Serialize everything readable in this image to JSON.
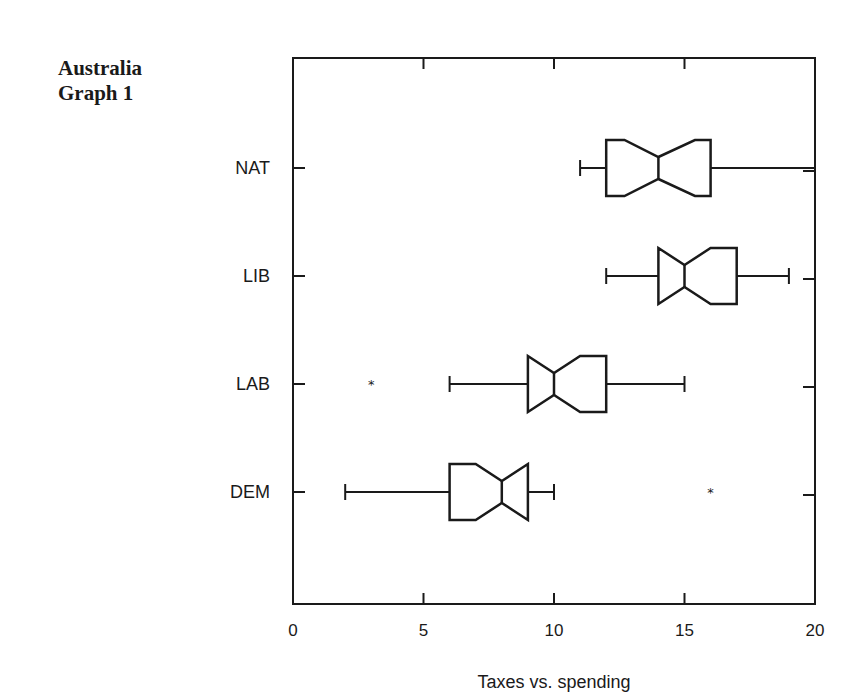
{
  "title": {
    "line1": "Australia",
    "line2": "Graph 1"
  },
  "chart_data": {
    "type": "boxplot",
    "orientation": "horizontal",
    "notched": true,
    "title": "Australia Graph 1",
    "xlabel": "Taxes vs. spending",
    "ylabel": "",
    "xlim": [
      0,
      20
    ],
    "xticks": [
      0,
      5,
      10,
      15,
      20
    ],
    "xtick_labels": [
      "0",
      "5",
      "10",
      "15",
      "20"
    ],
    "grid": false,
    "legend": null,
    "categories": [
      "NAT",
      "LIB",
      "LAB",
      "DEM"
    ],
    "series": [
      {
        "name": "NAT",
        "whisker_low": 11,
        "q1": 12,
        "notch_low": 12.7,
        "median": 14,
        "notch_high": 15.4,
        "q3": 16,
        "whisker_high": 20,
        "outliers": []
      },
      {
        "name": "LIB",
        "whisker_low": 12,
        "q1": 14,
        "notch_low": 14,
        "median": 15,
        "notch_high": 16,
        "q3": 17,
        "whisker_high": 19,
        "outliers": []
      },
      {
        "name": "LAB",
        "whisker_low": 6,
        "q1": 9,
        "notch_low": 9,
        "median": 10,
        "notch_high": 11,
        "q3": 12,
        "whisker_high": 15,
        "outliers": [
          3
        ]
      },
      {
        "name": "DEM",
        "whisker_low": 2,
        "q1": 6,
        "notch_low": 7,
        "median": 8,
        "notch_high": 9,
        "q3": 9,
        "whisker_high": 10,
        "outliers": [
          16
        ]
      }
    ]
  },
  "style": {
    "line_color": "#1a1a1a",
    "background": "#ffffff"
  }
}
